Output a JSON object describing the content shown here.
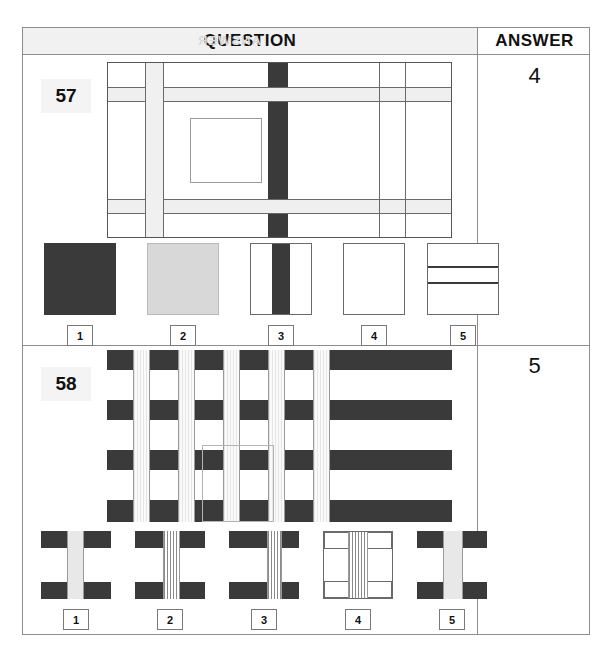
{
  "header": {
    "question_label": "QUESTION",
    "answer_label": "ANSWER",
    "ghost_text": "ANSWER"
  },
  "questions": [
    {
      "number": "57",
      "answer": "4",
      "matrix": {
        "description": "rectangular grid of intersecting light and dark bands with a small empty square at centre-left",
        "dark_color": "#3a3a3a",
        "band_color": "#efefef",
        "line_color": "#6a6a6a"
      },
      "options": [
        {
          "label": "1",
          "name": "solid-dark-square",
          "kind": "solid",
          "color": "#3a3a3a"
        },
        {
          "label": "2",
          "name": "solid-gray-square",
          "kind": "solid",
          "color": "#d8d8d8"
        },
        {
          "label": "3",
          "name": "dark-vertical-stripe",
          "kind": "vstripe",
          "color": "#3a3a3a"
        },
        {
          "label": "4",
          "name": "empty-white-square",
          "kind": "empty",
          "color": "#ffffff"
        },
        {
          "label": "5",
          "name": "two-horizontal-lines",
          "kind": "hlines",
          "color": "#3a3a3a"
        }
      ]
    },
    {
      "number": "58",
      "answer": "5",
      "matrix": {
        "description": "woven basket pattern of dark horizontal bands crossed by light vertical striped columns, with a faint highlighted cell near centre-bottom",
        "dark_color": "#3a3a3a",
        "column_color": "#f4f4f4",
        "highlight_color": "#b4b4b4"
      },
      "options": [
        {
          "label": "1",
          "name": "dark-bands-solid-column",
          "bands": "dark",
          "column": "solid"
        },
        {
          "label": "2",
          "name": "dark-bands-striped-column-center",
          "bands": "dark",
          "column": "striped"
        },
        {
          "label": "3",
          "name": "dark-bands-striped-column-right",
          "bands": "dark",
          "column": "striped"
        },
        {
          "label": "4",
          "name": "white-bands-striped-column",
          "bands": "white",
          "column": "striped"
        },
        {
          "label": "5",
          "name": "dark-bands-wide-light-column",
          "bands": "dark",
          "column": "solid"
        }
      ]
    }
  ]
}
